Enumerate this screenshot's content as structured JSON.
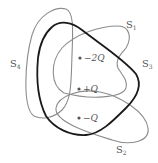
{
  "diagram": {
    "surfaces": [
      {
        "id": "S1",
        "label_main": "S",
        "label_sub": "1",
        "stroke": "#8c8c8c"
      },
      {
        "id": "S2",
        "label_main": "S",
        "label_sub": "2",
        "stroke": "#8c8c8c"
      },
      {
        "id": "S3",
        "label_main": "S",
        "label_sub": "3",
        "stroke": "#1a1a1a"
      },
      {
        "id": "S4",
        "label_main": "S",
        "label_sub": "4",
        "stroke": "#8c8c8c"
      }
    ],
    "charges": [
      {
        "label": "−2Q"
      },
      {
        "label": "+Q"
      },
      {
        "label": "−Q"
      }
    ]
  }
}
